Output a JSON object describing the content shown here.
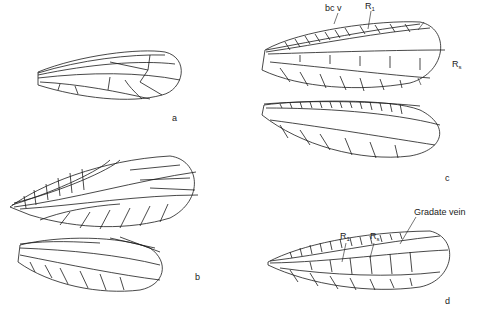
{
  "figure": {
    "panels": [
      {
        "id": "a",
        "label": "a",
        "wings": [
          "forewing"
        ]
      },
      {
        "id": "b",
        "label": "b",
        "wings": [
          "forewing",
          "hindwing"
        ]
      },
      {
        "id": "c",
        "label": "c",
        "wings": [
          "forewing",
          "hindwing"
        ],
        "annotations": [
          {
            "text": "bc v"
          },
          {
            "text": "R",
            "sub": "1"
          },
          {
            "text": "R",
            "sub": "s"
          }
        ]
      },
      {
        "id": "d",
        "label": "d",
        "wings": [
          "forewing"
        ],
        "annotations": [
          {
            "text": "R",
            "sub": "1"
          },
          {
            "text": "R",
            "sub": "s"
          },
          {
            "text": "Gradate vein"
          }
        ]
      }
    ]
  },
  "colors": {
    "ink": "#1a1a1a",
    "background": "#ffffff"
  }
}
